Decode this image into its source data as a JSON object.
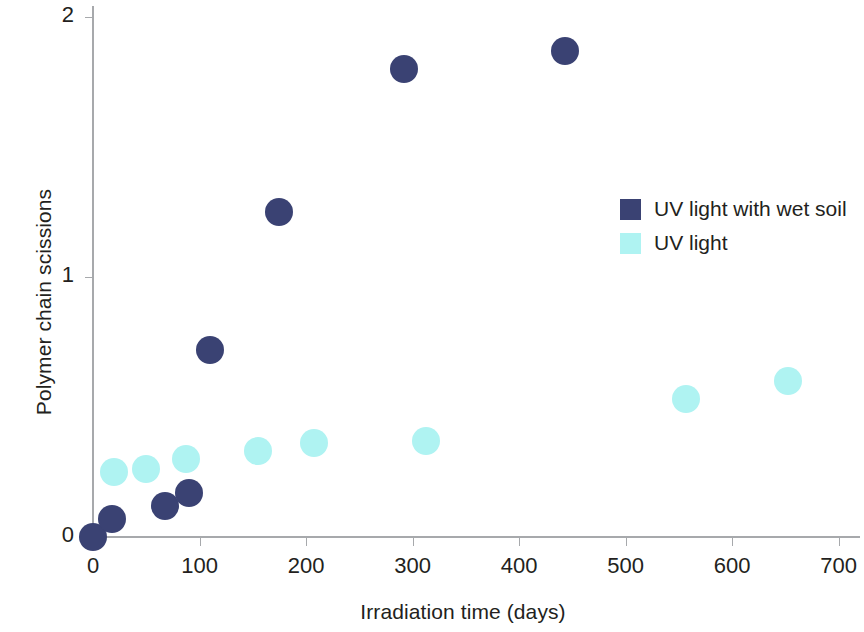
{
  "chart_data": {
    "type": "scatter",
    "title": "",
    "xlabel": "Irradiation time (days)",
    "ylabel": "Polymer chain scissions",
    "xlim": [
      0,
      720
    ],
    "ylim": [
      0,
      2.05
    ],
    "xticks": [
      0,
      100,
      200,
      300,
      400,
      500,
      600,
      700
    ],
    "xticklabels": [
      "0",
      "100",
      "200",
      "300",
      "400",
      "500",
      "600",
      "700"
    ],
    "yticks": [
      0,
      1,
      2
    ],
    "yticklabels": [
      "0",
      "1",
      "2"
    ],
    "grid": false,
    "legend_position": "right-center",
    "series": [
      {
        "name": "UV light with wet soil",
        "color": "#3a4273",
        "marker": "circle",
        "points": [
          {
            "x": 0,
            "y": 0.0
          },
          {
            "x": 18,
            "y": 0.07
          },
          {
            "x": 68,
            "y": 0.12
          },
          {
            "x": 90,
            "y": 0.17
          },
          {
            "x": 110,
            "y": 0.72
          },
          {
            "x": 175,
            "y": 1.25
          },
          {
            "x": 292,
            "y": 1.8
          },
          {
            "x": 443,
            "y": 1.87
          }
        ]
      },
      {
        "name": "UV light",
        "color": "#aff3f2",
        "marker": "circle",
        "points": [
          {
            "x": 20,
            "y": 0.25
          },
          {
            "x": 50,
            "y": 0.26
          },
          {
            "x": 87,
            "y": 0.3
          },
          {
            "x": 155,
            "y": 0.33
          },
          {
            "x": 207,
            "y": 0.36
          },
          {
            "x": 313,
            "y": 0.37
          },
          {
            "x": 557,
            "y": 0.53
          },
          {
            "x": 652,
            "y": 0.6
          }
        ]
      }
    ]
  },
  "legend": {
    "items": [
      {
        "label": "UV light with wet soil",
        "color": "#3a4273"
      },
      {
        "label": "UV light",
        "color": "#aff3f2"
      }
    ]
  },
  "colors": {
    "navy": "#3a4273",
    "cyan": "#aff3f2",
    "axis": "#a7a9ac",
    "text": "#231f20",
    "background": "#ffffff"
  }
}
